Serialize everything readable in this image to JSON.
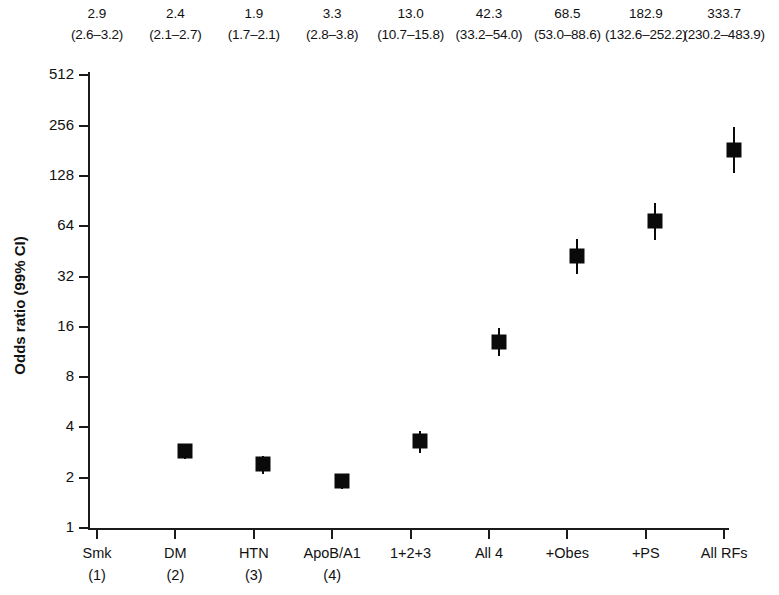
{
  "chart_data": {
    "type": "scatter",
    "title": "",
    "xlabel": "",
    "ylabel": "Odds ratio (99% CI)",
    "yscale": "log2",
    "ylim": [
      1,
      512
    ],
    "yticks": [
      1,
      2,
      4,
      8,
      16,
      32,
      64,
      128,
      256,
      512
    ],
    "ytick_labels": [
      "1",
      "2",
      "4",
      "8",
      "16",
      "32",
      "64",
      "128",
      "256",
      "512"
    ],
    "grid": false,
    "legend": "none",
    "categories": [
      "Smk",
      "DM",
      "HTN",
      "ApoB/A1",
      "1+2+3",
      "All 4",
      "+Obes",
      "+PS",
      "All RFs"
    ],
    "category_sublabels": [
      "(1)",
      "(2)",
      "(3)",
      "(4)",
      "",
      "",
      "",
      "",
      ""
    ],
    "values": [
      2.9,
      2.4,
      1.9,
      3.3,
      13.0,
      42.3,
      68.5,
      182.9,
      333.7
    ],
    "ci_low": [
      2.6,
      2.1,
      1.7,
      2.8,
      10.7,
      33.2,
      53.0,
      132.6,
      230.2
    ],
    "ci_high": [
      3.2,
      2.7,
      2.1,
      3.8,
      15.8,
      54.0,
      88.6,
      252.2,
      483.9
    ],
    "annotation_values": [
      "2.9",
      "2.4",
      "1.9",
      "3.3",
      "13.0",
      "42.3",
      "68.5",
      "182.9",
      "333.7"
    ],
    "annotation_ci": [
      "(2.6–3.2)",
      "(2.1–2.7)",
      "(1.7–2.1)",
      "(2.8–3.8)",
      "(10.7–15.8)",
      "(33.2–54.0)",
      "(53.0–88.6)",
      "(132.6–252.2)",
      "(230.2–483.9)"
    ],
    "marker_color": "#0a0a0a",
    "axis_color": "#1a1a1a",
    "background_color": "#ffffff"
  }
}
